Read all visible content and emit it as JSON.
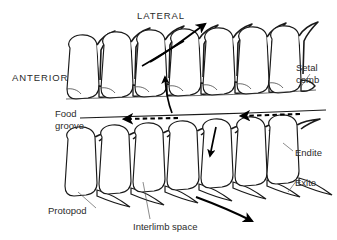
{
  "figure": {
    "type": "scientific-diagram",
    "background_color": "#ffffff",
    "ink_color": "#1a1a1a",
    "text_color": "#2b2b2b"
  },
  "labels": {
    "lateral": "LATERAL",
    "anterior": "ANTERIOR",
    "setal_comb_line1": "Setal",
    "setal_comb_line2": "comb",
    "food_groove_line1": "Food",
    "food_groove_line2": "groove",
    "endite": "Endite",
    "exite": "Exite",
    "protopod": "Protopod",
    "interlimb_space": "Interlimb space"
  },
  "annotations": {
    "flow_arrows": [
      {
        "name": "lateral-outflow-arrow",
        "direction": "up-right",
        "style": "solid",
        "row": "upper"
      },
      {
        "name": "interlimb-suction-arrow",
        "direction": "up",
        "style": "solid",
        "row": "upper"
      },
      {
        "name": "food-groove-arrow-left",
        "direction": "left",
        "style": "dashed"
      },
      {
        "name": "food-groove-arrow-right",
        "direction": "left",
        "style": "dashed"
      },
      {
        "name": "interlimb-inflow-arrow",
        "direction": "down",
        "style": "solid",
        "row": "lower"
      },
      {
        "name": "lateral-outflow-arrow-lower",
        "direction": "down-right",
        "style": "solid",
        "row": "lower"
      }
    ],
    "limb_count_upper": 7,
    "limb_count_lower": 7
  }
}
